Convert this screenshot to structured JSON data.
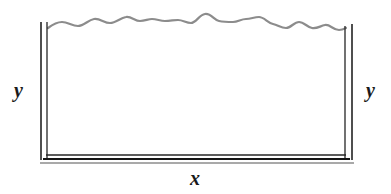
{
  "figure": {
    "background_color": "#ffffff",
    "width": 391,
    "height": 194,
    "labels": {
      "y_left": "y",
      "y_right": "y",
      "x_bottom": "x"
    },
    "elements": {
      "river": {
        "name": "river",
        "description": "wavy line along the top edge",
        "color": "#8c8c8c",
        "stroke_width": 2.2
      },
      "fence_left": {
        "name": "left fence",
        "description": "double vertical line on the left side",
        "color": "#151515",
        "stroke_width": 1.4
      },
      "fence_right": {
        "name": "right fence",
        "description": "double vertical line on the right side",
        "color": "#151515",
        "stroke_width": 1.4
      },
      "fence_bottom": {
        "name": "bottom fence",
        "description": "double horizontal line along the bottom side",
        "color": "#151515",
        "stroke_width": 1.4
      }
    },
    "geometry": {
      "fence_inner_left_x": 47,
      "fence_outer_left_x": 41,
      "fence_inner_right_x": 345,
      "fence_outer_right_x": 352,
      "fence_inner_bottom_y": 155,
      "fence_outer_bottom_y": 162,
      "fence_top_y": 24,
      "river_baseline_y": 20
    }
  }
}
